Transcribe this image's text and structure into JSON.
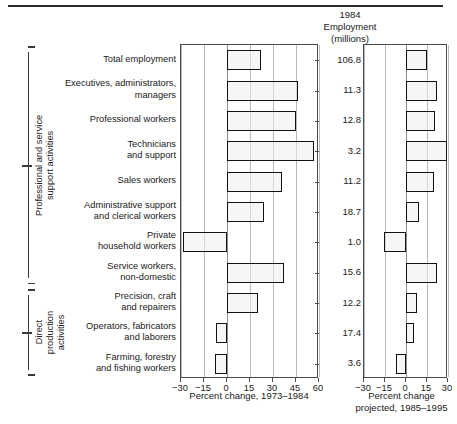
{
  "figure": {
    "header_lines": [
      "1984",
      "Employment",
      "(millions)"
    ],
    "employment_column_header": "1984 Employment (millions)"
  },
  "groups": [
    {
      "name": "professional-and-service",
      "label": "Professional and service\nsupport activities",
      "first_row": 0,
      "last_row": 7
    },
    {
      "name": "direct-production",
      "label": "Direct\nproduction\nactivities",
      "first_row": 8,
      "last_row": 10
    }
  ],
  "axes": {
    "left": {
      "title": "Percent change, 1973–1984",
      "ticks": [
        "−30",
        "−15",
        "0",
        "15",
        "30",
        "45",
        "60"
      ],
      "tick_values": [
        -30,
        -15,
        0,
        15,
        30,
        45,
        60
      ],
      "min": -30,
      "max": 60
    },
    "right": {
      "title_lines": [
        "Percent change",
        "projected, 1985–1995"
      ],
      "title": "Percent change projected, 1985–1995",
      "ticks": [
        "−30",
        "−15",
        "0",
        "15",
        "30"
      ],
      "tick_values": [
        -30,
        -15,
        0,
        15,
        30
      ],
      "min": -30,
      "max": 30
    }
  },
  "chart_data": {
    "type": "bar",
    "orientation": "horizontal",
    "grid": true,
    "legend": "none",
    "categories": [
      "Total employment",
      "Executives, administrators, managers",
      "Professional workers",
      "Technicians and support",
      "Sales workers",
      "Administrative support and clerical workers",
      "Private household workers",
      "Service workers, non-domestic",
      "Precision, craft and repairers",
      "Operators, fabricators and laborers",
      "Farming, forestry and fishing workers"
    ],
    "category_lines": [
      [
        "Total employment"
      ],
      [
        "Executives, administrators,",
        "managers"
      ],
      [
        "Professional workers"
      ],
      [
        "Technicians",
        "and support"
      ],
      [
        "Sales workers"
      ],
      [
        "Administrative support",
        "and clerical workers"
      ],
      [
        "Private",
        "household workers"
      ],
      [
        "Service workers,",
        "non-domestic"
      ],
      [
        "Precision, craft",
        "and repairers"
      ],
      [
        "Operators, fabricators",
        "and laborers"
      ],
      [
        "Farming, forestry",
        "and fishing workers"
      ]
    ],
    "employment_1984_millions": [
      106.8,
      11.3,
      12.8,
      3.2,
      11.2,
      18.7,
      1.0,
      15.6,
      12.2,
      17.4,
      3.6
    ],
    "employment_labels": [
      "106.8",
      "11.3",
      "12.8",
      "3.2",
      "11.2",
      "18.7",
      "1.0",
      "15.6",
      "12.2",
      "17.4",
      "3.6"
    ],
    "series": [
      {
        "name": "Percent change, 1973–1984",
        "xlabel": "Percent change, 1973–1984",
        "xlim": [
          -30,
          60
        ],
        "values": [
          22,
          46,
          45,
          57,
          36,
          24,
          -29,
          37,
          20,
          -7,
          -8
        ]
      },
      {
        "name": "Percent change projected, 1985–1995",
        "xlabel": "Percent change projected, 1985–1995",
        "xlim": [
          -30,
          30
        ],
        "values": [
          15,
          22,
          21,
          29,
          20,
          9,
          -16,
          22,
          8,
          6,
          -7
        ]
      }
    ]
  },
  "style": {
    "bar_border": "#111111",
    "bar_fill": "#eeeeee",
    "grid_color": "#b9b9b9",
    "frame_color": "#4a4a4a"
  }
}
